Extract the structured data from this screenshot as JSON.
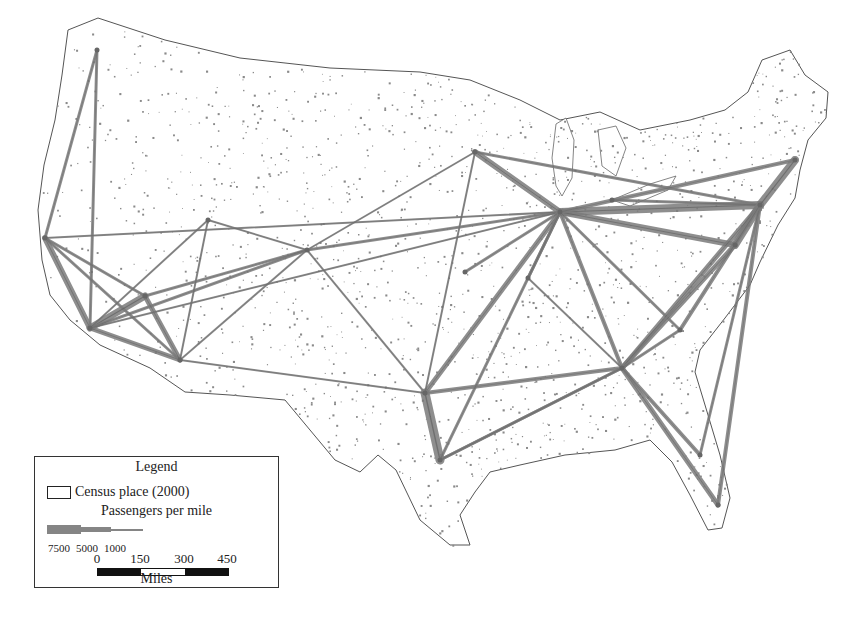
{
  "map": {
    "subject": "Passenger flows between US metropolitan areas",
    "colors": {
      "route": "#7b7b7b",
      "outline": "#555555",
      "census_place": "#8a8a8a",
      "background": "#ffffff"
    },
    "hubs": [
      {
        "name": "Seattle",
        "x": 97,
        "y": 50
      },
      {
        "name": "San Francisco",
        "x": 45,
        "y": 238
      },
      {
        "name": "Los Angeles",
        "x": 90,
        "y": 328
      },
      {
        "name": "Las Vegas",
        "x": 145,
        "y": 296
      },
      {
        "name": "Phoenix",
        "x": 180,
        "y": 360
      },
      {
        "name": "Salt Lake City",
        "x": 208,
        "y": 220
      },
      {
        "name": "Denver",
        "x": 307,
        "y": 250
      },
      {
        "name": "Minneapolis",
        "x": 475,
        "y": 152
      },
      {
        "name": "Chicago",
        "x": 560,
        "y": 212
      },
      {
        "name": "Kansas City",
        "x": 465,
        "y": 272
      },
      {
        "name": "St. Louis",
        "x": 528,
        "y": 278
      },
      {
        "name": "Dallas",
        "x": 425,
        "y": 393
      },
      {
        "name": "Houston",
        "x": 440,
        "y": 460
      },
      {
        "name": "Atlanta",
        "x": 622,
        "y": 368
      },
      {
        "name": "Charlotte",
        "x": 680,
        "y": 330
      },
      {
        "name": "Washington",
        "x": 735,
        "y": 245
      },
      {
        "name": "New York",
        "x": 760,
        "y": 205
      },
      {
        "name": "Boston",
        "x": 795,
        "y": 160
      },
      {
        "name": "Detroit",
        "x": 612,
        "y": 200
      },
      {
        "name": "Miami",
        "x": 718,
        "y": 505
      },
      {
        "name": "Orlando",
        "x": 700,
        "y": 455
      }
    ],
    "routes": [
      {
        "from": 0,
        "to": 1,
        "w": 3
      },
      {
        "from": 0,
        "to": 2,
        "w": 3
      },
      {
        "from": 1,
        "to": 2,
        "w": 6
      },
      {
        "from": 1,
        "to": 3,
        "w": 3
      },
      {
        "from": 1,
        "to": 4,
        "w": 3
      },
      {
        "from": 2,
        "to": 3,
        "w": 7
      },
      {
        "from": 2,
        "to": 4,
        "w": 5
      },
      {
        "from": 2,
        "to": 6,
        "w": 3
      },
      {
        "from": 3,
        "to": 4,
        "w": 5
      },
      {
        "from": 3,
        "to": 6,
        "w": 3
      },
      {
        "from": 5,
        "to": 2,
        "w": 2
      },
      {
        "from": 5,
        "to": 6,
        "w": 2
      },
      {
        "from": 5,
        "to": 4,
        "w": 2
      },
      {
        "from": 6,
        "to": 4,
        "w": 2
      },
      {
        "from": 6,
        "to": 7,
        "w": 2
      },
      {
        "from": 6,
        "to": 8,
        "w": 3
      },
      {
        "from": 6,
        "to": 11,
        "w": 2
      },
      {
        "from": 1,
        "to": 8,
        "w": 2
      },
      {
        "from": 2,
        "to": 8,
        "w": 2
      },
      {
        "from": 7,
        "to": 8,
        "w": 6
      },
      {
        "from": 7,
        "to": 16,
        "w": 3
      },
      {
        "from": 8,
        "to": 16,
        "w": 8
      },
      {
        "from": 8,
        "to": 15,
        "w": 6
      },
      {
        "from": 8,
        "to": 17,
        "w": 4
      },
      {
        "from": 8,
        "to": 11,
        "w": 5
      },
      {
        "from": 8,
        "to": 9,
        "w": 3
      },
      {
        "from": 8,
        "to": 13,
        "w": 4
      },
      {
        "from": 8,
        "to": 14,
        "w": 3
      },
      {
        "from": 8,
        "to": 10,
        "w": 3
      },
      {
        "from": 18,
        "to": 16,
        "w": 3
      },
      {
        "from": 16,
        "to": 15,
        "w": 8
      },
      {
        "from": 16,
        "to": 17,
        "w": 8
      },
      {
        "from": 15,
        "to": 13,
        "w": 5
      },
      {
        "from": 16,
        "to": 13,
        "w": 5
      },
      {
        "from": 16,
        "to": 19,
        "w": 4
      },
      {
        "from": 16,
        "to": 20,
        "w": 3
      },
      {
        "from": 13,
        "to": 11,
        "w": 4
      },
      {
        "from": 13,
        "to": 12,
        "w": 3
      },
      {
        "from": 13,
        "to": 19,
        "w": 5
      },
      {
        "from": 13,
        "to": 20,
        "w": 4
      },
      {
        "from": 13,
        "to": 14,
        "w": 3
      },
      {
        "from": 11,
        "to": 12,
        "w": 9
      },
      {
        "from": 11,
        "to": 4,
        "w": 2
      },
      {
        "from": 11,
        "to": 7,
        "w": 2
      },
      {
        "from": 12,
        "to": 13,
        "w": 3
      },
      {
        "from": 14,
        "to": 16,
        "w": 4
      },
      {
        "from": 13,
        "to": 10,
        "w": 2
      },
      {
        "from": 12,
        "to": 8,
        "w": 3
      }
    ]
  },
  "legend": {
    "title": "Legend",
    "census_label": "Census place (2000)",
    "ppm_title": "Passengers per mile",
    "ppm_values": [
      "7500",
      "5000",
      "1000"
    ],
    "scale_ticks": [
      "0",
      "150",
      "300",
      "450"
    ],
    "scale_units": "Miles"
  }
}
